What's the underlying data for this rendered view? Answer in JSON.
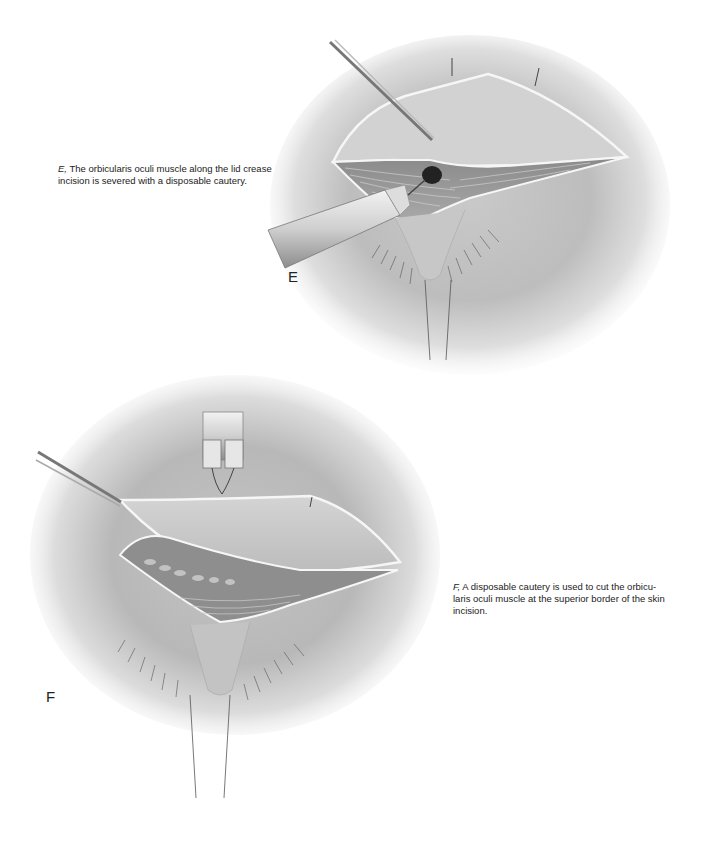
{
  "figure_e": {
    "label": "E",
    "caption_lead": "E,",
    "caption_line1": " The orbicularis oculi muscle along the lid crease",
    "caption_line2": "incision is severed with a disposable cautery."
  },
  "figure_f": {
    "label": "F",
    "caption_lead": "F,",
    "caption_line1": " A disposable cautery is used to cut the orbicu-",
    "caption_line2": "laris oculi muscle at the superior border of the skin",
    "caption_line3": "incision."
  }
}
